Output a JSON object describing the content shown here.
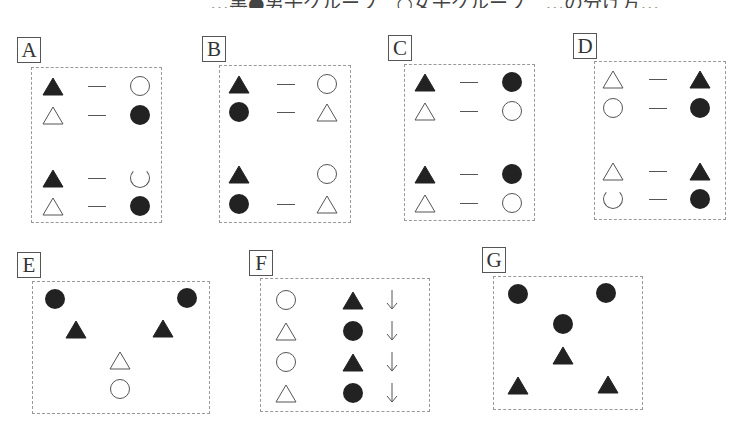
{
  "header": {
    "clipped_text": "…黒●男子グループ　○女子グループ　…の分け方…"
  },
  "colors": {
    "filled": "#222222",
    "outline": "#555555",
    "dashed_border": "#999999"
  },
  "panels": [
    {
      "label": "A",
      "layout": "pairs",
      "rows": [
        [
          "filled-triangle",
          "dash",
          "open-circle"
        ],
        [
          "open-triangle",
          "dash",
          "filled-circle"
        ],
        [
          "filled-triangle",
          "dash",
          "broken-circle"
        ],
        [
          "open-triangle",
          "dash",
          "filled-circle"
        ]
      ]
    },
    {
      "label": "B",
      "layout": "pairs",
      "rows": [
        [
          "filled-triangle",
          "dash",
          "open-circle"
        ],
        [
          "filled-circle",
          "dash",
          "open-triangle"
        ],
        [
          "filled-triangle",
          "none",
          "open-circle"
        ],
        [
          "filled-circle",
          "dash",
          "open-triangle"
        ]
      ]
    },
    {
      "label": "C",
      "layout": "pairs",
      "rows": [
        [
          "filled-triangle",
          "dash",
          "filled-circle"
        ],
        [
          "open-triangle",
          "dash",
          "open-circle"
        ],
        [
          "filled-triangle",
          "dash",
          "filled-circle"
        ],
        [
          "open-triangle",
          "dash",
          "open-circle"
        ]
      ]
    },
    {
      "label": "D",
      "layout": "pairs",
      "rows": [
        [
          "open-triangle",
          "dash",
          "filled-triangle"
        ],
        [
          "open-circle",
          "dash",
          "filled-circle"
        ],
        [
          "open-triangle",
          "dash",
          "filled-triangle"
        ],
        [
          "broken-circle",
          "dash",
          "filled-circle"
        ]
      ]
    },
    {
      "label": "E",
      "layout": "v-shape",
      "items": [
        "filled-circle",
        "filled-circle",
        "filled-triangle",
        "filled-triangle",
        "open-triangle",
        "open-circle"
      ]
    },
    {
      "label": "F",
      "layout": "columns",
      "rows": [
        [
          "open-circle",
          "filled-triangle",
          "down-arrow"
        ],
        [
          "open-triangle",
          "filled-circle",
          "down-arrow"
        ],
        [
          "open-circle",
          "filled-triangle",
          "down-arrow"
        ],
        [
          "open-triangle",
          "filled-circle",
          "down-arrow"
        ]
      ]
    },
    {
      "label": "G",
      "layout": "scatter",
      "items": [
        "filled-circle",
        "filled-circle",
        "filled-circle",
        "filled-triangle",
        "filled-triangle",
        "filled-triangle"
      ]
    }
  ]
}
